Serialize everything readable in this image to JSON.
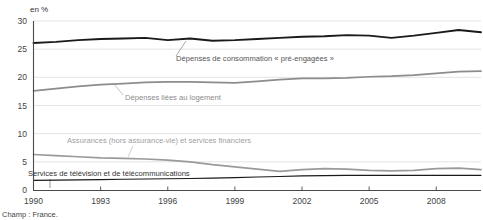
{
  "unit_label": "en %",
  "footnote": "Champ : France.",
  "chart_data": {
    "type": "line",
    "title": "",
    "subtitle": "",
    "xlabel": "",
    "ylabel": "en %",
    "ylim": [
      0,
      30
    ],
    "xlim": [
      1990,
      2010
    ],
    "grid": true,
    "legend_position": "inline-annotations",
    "ytick_labels": [
      "0",
      "5",
      "10",
      "15",
      "20",
      "25",
      "30"
    ],
    "yticks": [
      0,
      5,
      10,
      15,
      20,
      25,
      30
    ],
    "xtick_labels": [
      "1990",
      "1993",
      "1996",
      "1999",
      "2002",
      "2005",
      "2008"
    ],
    "xticks": [
      1990,
      1993,
      1996,
      1999,
      2002,
      2005,
      2008
    ],
    "x": [
      1990,
      1991,
      1992,
      1993,
      1994,
      1995,
      1996,
      1997,
      1998,
      1999,
      2000,
      2001,
      2002,
      2003,
      2004,
      2005,
      2006,
      2007,
      2008,
      2009,
      2010
    ],
    "series": [
      {
        "name": "Dépenses de consommation « pré-engagées »",
        "color": "#1a1a1a",
        "width": 1.9,
        "values": [
          26.1,
          26.3,
          26.6,
          26.8,
          26.9,
          27.0,
          26.6,
          26.9,
          26.5,
          26.6,
          26.8,
          27.0,
          27.2,
          27.3,
          27.5,
          27.4,
          27.0,
          27.4,
          27.9,
          28.4,
          28.0
        ]
      },
      {
        "name": "Dépenses liées au logement",
        "color": "#8c8c8c",
        "width": 1.7,
        "values": [
          17.6,
          18.0,
          18.4,
          18.7,
          18.9,
          19.1,
          19.2,
          19.2,
          19.1,
          19.0,
          19.3,
          19.6,
          19.8,
          19.8,
          19.9,
          20.1,
          20.2,
          20.4,
          20.7,
          21.0,
          21.1
        ]
      },
      {
        "name": "Assurances (hors assurance-vie) et services financiers",
        "color": "#9a9a9a",
        "width": 1.7,
        "values": [
          6.3,
          6.1,
          5.9,
          5.7,
          5.6,
          5.5,
          5.3,
          5.0,
          4.5,
          4.1,
          3.7,
          3.3,
          3.6,
          3.8,
          3.7,
          3.5,
          3.4,
          3.5,
          3.8,
          3.9,
          3.6
        ]
      },
      {
        "name": "Services de télévision et de télécommunications",
        "color": "#1a1a1a",
        "width": 1.1,
        "values": [
          1.7,
          1.75,
          1.8,
          1.85,
          1.9,
          1.95,
          2.0,
          2.05,
          2.1,
          2.2,
          2.3,
          2.4,
          2.5,
          2.55,
          2.6,
          2.6,
          2.6,
          2.6,
          2.6,
          2.6,
          2.6
        ]
      }
    ],
    "annotations": [
      {
        "text": "Dépenses de consommation « pré-engagées »",
        "color": "#555555",
        "x": 176,
        "y": 61,
        "leader": [
          176,
          56,
          186,
          41
        ]
      },
      {
        "text": "Dépenses liées au logement",
        "color": "#8a8a8a",
        "x": 125,
        "y": 100,
        "leader": [
          123,
          95,
          114,
          84
        ]
      },
      {
        "text": "Assurances (hors assurance-vie) et services financiers",
        "color": "#a0a0a0",
        "x": 67,
        "y": 143,
        "leader": [
          133,
          146,
          128,
          157
        ]
      },
      {
        "text": "Services de télévision et de télécommunications",
        "color": "#333333",
        "x": 28,
        "y": 176,
        "leader": [
          50,
          179,
          50,
          188
        ]
      }
    ]
  }
}
